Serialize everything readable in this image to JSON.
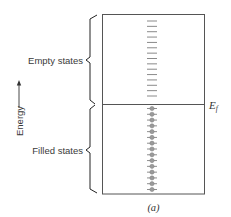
{
  "figure": {
    "caption": "(a)",
    "axis_label": "Energy",
    "fermi_label": "E",
    "fermi_subscript": "f",
    "regions": [
      {
        "id": "empty",
        "label": "Empty states",
        "level_count": 15
      },
      {
        "id": "filled",
        "label": "Filled states",
        "level_count": 15
      }
    ],
    "colors": {
      "box_stroke": "#555555",
      "empty_level": "#8a8a8a",
      "filled_level": "#8f8f8f",
      "electron": "#9a9a9a",
      "brace": "#222222",
      "text": "#3a3a3a"
    }
  }
}
